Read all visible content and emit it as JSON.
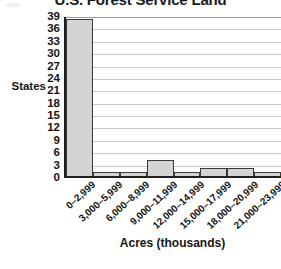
{
  "chart_data": {
    "type": "bar",
    "title": "U.S. Forest Service Land",
    "xlabel": "Acres (thousands)",
    "ylabel": "States",
    "categories": [
      "0–2,999",
      "3,000–5,999",
      "6,000–8,999",
      "9,000–11,999",
      "12,000–14,999",
      "15,000–17,999",
      "18,000–20,999",
      "21,000–23,999"
    ],
    "values": [
      38,
      1,
      1,
      4,
      1,
      2,
      2,
      1
    ],
    "ylim": [
      0,
      39
    ],
    "ytick_labels": [
      "39",
      "36",
      "33",
      "30",
      "27",
      "24",
      "21",
      "18",
      "15",
      "12",
      "9",
      "6",
      "3",
      "0"
    ],
    "ytick_values": [
      39,
      36,
      33,
      30,
      27,
      24,
      21,
      18,
      15,
      12,
      9,
      6,
      3,
      0
    ],
    "ytick_step": 3,
    "grid": true,
    "legend": false,
    "legend_position": "none",
    "bar_fill_color": "#d4d4d4",
    "bar_border_color": "#3a3a3a",
    "gridline_color": "#c9c9c9",
    "axis_color": "#1f1f1f",
    "text_color": "#151515"
  }
}
